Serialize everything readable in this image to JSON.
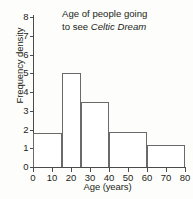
{
  "chart_data": {
    "type": "bar",
    "title": "Age of people going to see Celtic Dream",
    "title_line1": "Age of people going",
    "title_line2_prefix": "to see ",
    "title_line2_emphasis": "Celtic Dream",
    "xlabel": "Age (years)",
    "ylabel": "Frequency density",
    "xlim": [
      0,
      80
    ],
    "ylim": [
      0,
      8
    ],
    "grid": false,
    "legend": null,
    "x_ticks": [
      0,
      10,
      20,
      30,
      40,
      50,
      60,
      70,
      80
    ],
    "y_ticks": [
      0,
      1,
      2,
      3,
      4,
      5,
      6,
      7,
      8
    ],
    "x_tick_labels": [
      "0",
      "10",
      "20",
      "30",
      "40",
      "50",
      "60",
      "70",
      "80"
    ],
    "y_tick_labels": [
      "0",
      "1",
      "2",
      "3",
      "4",
      "5",
      "6",
      "7",
      "8"
    ],
    "bin_edges": [
      0,
      15,
      25,
      40,
      60,
      80
    ],
    "categories": [
      "0-15",
      "15-25",
      "25-40",
      "40-60",
      "60-80"
    ],
    "values": [
      1.8,
      5.0,
      3.45,
      1.85,
      1.2
    ],
    "bars": [
      {
        "label": "0-15",
        "start": 0,
        "end": 15,
        "value": 1.8
      },
      {
        "label": "15-25",
        "start": 15,
        "end": 25,
        "value": 5.0
      },
      {
        "label": "25-40",
        "start": 25,
        "end": 40,
        "value": 3.45
      },
      {
        "label": "40-60",
        "start": 40,
        "end": 60,
        "value": 1.85
      },
      {
        "label": "60-80",
        "start": 60,
        "end": 80,
        "value": 1.2
      }
    ],
    "colors": {
      "bar_fill": "#ffffff",
      "bar_edge": "#6a6a6a",
      "axis": "#4b4b4b",
      "text": "#231f20",
      "background": "#fdfdfb"
    }
  }
}
